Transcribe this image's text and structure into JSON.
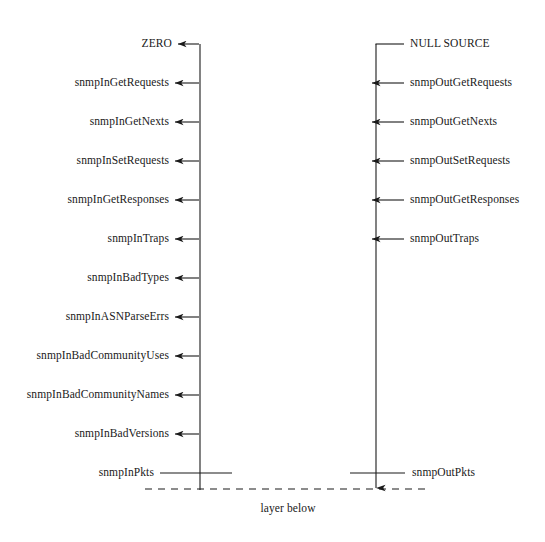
{
  "diagram": {
    "layer_label": "layer below",
    "stroke_color": "#1a1a1a",
    "background_color": "#ffffff",
    "left_column": {
      "axis_x": 200,
      "top_label": "ZERO",
      "bottom_label": "snmpInPkts",
      "items": [
        {
          "label": "ZERO",
          "y": 44,
          "arrow": "corner-left"
        },
        {
          "label": "snmpInGetRequests",
          "y": 83,
          "arrow": "left"
        },
        {
          "label": "snmpInGetNexts",
          "y": 122,
          "arrow": "left"
        },
        {
          "label": "snmpInSetRequests",
          "y": 161,
          "arrow": "left"
        },
        {
          "label": "snmpInGetResponses",
          "y": 200,
          "arrow": "left"
        },
        {
          "label": "snmpInTraps",
          "y": 239,
          "arrow": "left"
        },
        {
          "label": "snmpInBadTypes",
          "y": 278,
          "arrow": "left"
        },
        {
          "label": "snmpInASNParseErrs",
          "y": 317,
          "arrow": "left"
        },
        {
          "label": "snmpInBadCommunityUses",
          "y": 356,
          "arrow": "left"
        },
        {
          "label": "snmpInBadCommunityNames",
          "y": 395,
          "arrow": "left"
        },
        {
          "label": "snmpInBadVersions",
          "y": 434,
          "arrow": "left"
        },
        {
          "label": "snmpInPkts",
          "y": 473,
          "arrow": "none"
        }
      ]
    },
    "right_column": {
      "axis_x": 376,
      "top_label": "NULL SOURCE",
      "bottom_label": "snmpOutPkts",
      "items": [
        {
          "label": "NULL SOURCE",
          "y": 44,
          "arrow": "corner-right"
        },
        {
          "label": "snmpOutGetRequests",
          "y": 83,
          "arrow": "left"
        },
        {
          "label": "snmpOutGetNexts",
          "y": 122,
          "arrow": "left"
        },
        {
          "label": "snmpOutSetRequests",
          "y": 161,
          "arrow": "left"
        },
        {
          "label": "snmpOutGetResponses",
          "y": 200,
          "arrow": "left"
        },
        {
          "label": "snmpOutTraps",
          "y": 239,
          "arrow": "left"
        },
        {
          "label": "snmpOutPkts",
          "y": 473,
          "arrow": "none"
        }
      ]
    },
    "dashed_line": {
      "y": 489,
      "x_start": 145,
      "x_end": 430
    }
  }
}
